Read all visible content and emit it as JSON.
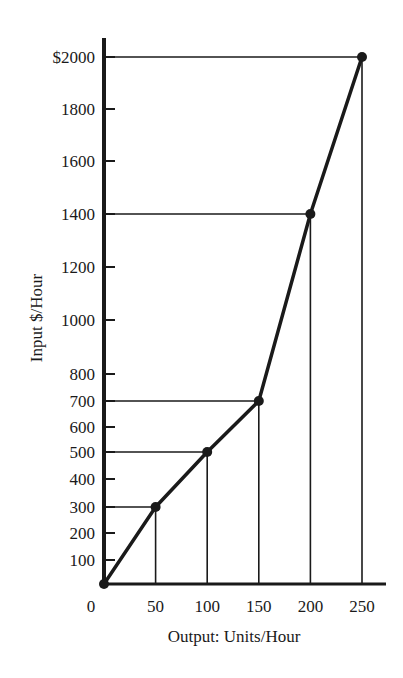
{
  "chart_data": {
    "type": "line",
    "title": "",
    "xlabel": "Output: Units/Hour",
    "ylabel": "Input $/Hour",
    "x": [
      0,
      50,
      100,
      150,
      200,
      250
    ],
    "series": [
      {
        "name": "Input cost",
        "values": [
          0,
          300,
          500,
          700,
          1400,
          2000
        ]
      }
    ],
    "x_ticks": [
      {
        "value": 0,
        "label": "0"
      },
      {
        "value": 50,
        "label": "50"
      },
      {
        "value": 100,
        "label": "100"
      },
      {
        "value": 150,
        "label": "150"
      },
      {
        "value": 200,
        "label": "200"
      },
      {
        "value": 250,
        "label": "250"
      }
    ],
    "y_ticks": [
      {
        "value": 100,
        "label": "100"
      },
      {
        "value": 200,
        "label": "200"
      },
      {
        "value": 300,
        "label": "300"
      },
      {
        "value": 400,
        "label": "400"
      },
      {
        "value": 500,
        "label": "500"
      },
      {
        "value": 600,
        "label": "600"
      },
      {
        "value": 700,
        "label": "700"
      },
      {
        "value": 800,
        "label": "800"
      },
      {
        "value": 1000,
        "label": "1000"
      },
      {
        "value": 1200,
        "label": "1200"
      },
      {
        "value": 1400,
        "label": "1400"
      },
      {
        "value": 1600,
        "label": "1600"
      },
      {
        "value": 1800,
        "label": "1800"
      },
      {
        "value": 2000,
        "label": "$2000"
      }
    ],
    "xlim": [
      0,
      270
    ],
    "ylim": [
      0,
      2000
    ],
    "y_scale_note": "non-linear: 0-800 expanded, 800-2000 compressed",
    "grid": false,
    "legend": null,
    "annotations": "drop lines from each point to both axes",
    "colors": {
      "line": "#1a1a1a",
      "axis": "#1a1a1a",
      "background": "#ffffff"
    }
  }
}
